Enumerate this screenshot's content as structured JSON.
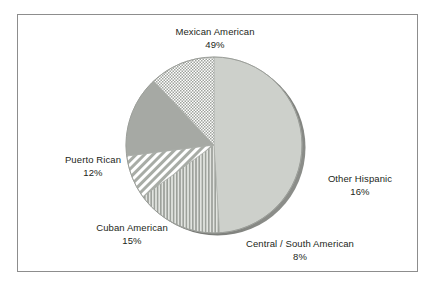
{
  "figure": {
    "background_color": "#ffffff",
    "frame_color": "#8d8d8d",
    "text_color": "#231f20"
  },
  "chart_data": {
    "type": "pie",
    "title": "",
    "subtitle": "",
    "xlabel": "",
    "ylabel": "",
    "legend_position": "none",
    "grid": false,
    "labels_on_slices": false,
    "label_format": "name + percent",
    "start_angle_deg": 90,
    "direction": "clockwise",
    "three_d_shadow": true,
    "categories": [
      "Mexican American",
      "Other Hispanic",
      "Central / South American",
      "Cuban American",
      "Puerto Rican"
    ],
    "values": [
      49,
      16,
      8,
      15,
      12
    ],
    "units": "percent",
    "total": 100,
    "slices": [
      {
        "name": "Mexican American",
        "value": 49,
        "value_label": "49%",
        "fill": "solid-light-gray",
        "color": "#cdd0cb",
        "label_position": "top"
      },
      {
        "name": "Other Hispanic",
        "value": 16,
        "value_label": "16%",
        "fill": "vertical-stripes",
        "color": "#a9aca7",
        "label_position": "right"
      },
      {
        "name": "Central / South American",
        "value": 8,
        "value_label": "8%",
        "fill": "diagonal-stripes",
        "color": "#b4b7b2",
        "label_position": "bottom-right"
      },
      {
        "name": "Cuban American",
        "value": 15,
        "value_label": "15%",
        "fill": "solid-medium-gray",
        "color": "#a6a9a4",
        "label_position": "bottom-left"
      },
      {
        "name": "Puerto Rican",
        "value": 12,
        "value_label": "12%",
        "fill": "checkerboard",
        "color": "#bfc2bd",
        "label_position": "left"
      }
    ]
  },
  "labels": {
    "mexican_american": {
      "name": "Mexican American",
      "value": "49%"
    },
    "puerto_rican": {
      "name": "Puerto Rican",
      "value": "12%"
    },
    "cuban_american": {
      "name": "Cuban American",
      "value": "15%"
    },
    "other_hispanic": {
      "name": "Other Hispanic",
      "value": "16%"
    },
    "central_south_american": {
      "name": "Central / South American",
      "value": "8%"
    }
  }
}
